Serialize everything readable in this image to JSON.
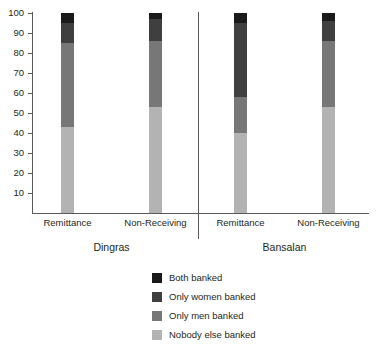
{
  "chart_data": {
    "type": "bar",
    "subtype": "stacked-percent",
    "title": "",
    "xlabel": "",
    "ylabel": "",
    "ylim": [
      0,
      100
    ],
    "yticks": [
      10,
      20,
      30,
      40,
      50,
      60,
      70,
      80,
      90,
      100
    ],
    "ytick_labels": [
      "10",
      "20",
      "30",
      "40",
      "50",
      "60",
      "70",
      "80",
      "90",
      "100"
    ],
    "grid": false,
    "legend_position": "bottom-center",
    "categories": [
      "Remittance",
      "Non-Receiving",
      "Remittance",
      "Non-Receiving"
    ],
    "groups": [
      {
        "label": "Dingras",
        "categories": [
          "Remittance",
          "Non-Receiving"
        ]
      },
      {
        "label": "Bansalan",
        "categories": [
          "Remittance",
          "Non-Receiving"
        ]
      }
    ],
    "series": [
      {
        "name": "Both banked",
        "color": "#1a1a1a",
        "values": [
          5,
          3,
          5,
          4
        ]
      },
      {
        "name": "Only women banked",
        "color": "#3f3f3f",
        "values": [
          10,
          11,
          37,
          10
        ]
      },
      {
        "name": "Only men banked",
        "color": "#777777",
        "values": [
          42,
          33,
          18,
          33
        ]
      },
      {
        "name": "Nobody else banked",
        "color": "#b3b3b3",
        "values": [
          43,
          53,
          40,
          53
        ]
      }
    ],
    "bars": [
      {
        "group": "Dingras",
        "category": "Remittance",
        "segments": [
          {
            "name": "Both banked",
            "value": 5,
            "cum_top": 100
          },
          {
            "name": "Only women banked",
            "value": 10,
            "cum_top": 95
          },
          {
            "name": "Only men banked",
            "value": 42,
            "cum_top": 85
          },
          {
            "name": "Nobody else banked",
            "value": 43,
            "cum_top": 43
          }
        ]
      },
      {
        "group": "Dingras",
        "category": "Non-Receiving",
        "segments": [
          {
            "name": "Both banked",
            "value": 3,
            "cum_top": 100
          },
          {
            "name": "Only women banked",
            "value": 11,
            "cum_top": 97
          },
          {
            "name": "Only men banked",
            "value": 33,
            "cum_top": 86
          },
          {
            "name": "Nobody else banked",
            "value": 53,
            "cum_top": 53
          }
        ]
      },
      {
        "group": "Bansalan",
        "category": "Remittance",
        "segments": [
          {
            "name": "Both banked",
            "value": 5,
            "cum_top": 100
          },
          {
            "name": "Only women banked",
            "value": 37,
            "cum_top": 95
          },
          {
            "name": "Only men banked",
            "value": 18,
            "cum_top": 58
          },
          {
            "name": "Nobody else banked",
            "value": 40,
            "cum_top": 40
          }
        ]
      },
      {
        "group": "Bansalan",
        "category": "Non-Receiving",
        "segments": [
          {
            "name": "Both banked",
            "value": 4,
            "cum_top": 100
          },
          {
            "name": "Only women banked",
            "value": 10,
            "cum_top": 96
          },
          {
            "name": "Only men banked",
            "value": 33,
            "cum_top": 86
          },
          {
            "name": "Nobody else banked",
            "value": 53,
            "cum_top": 53
          }
        ]
      }
    ]
  },
  "axis": {
    "ytick_labels": [
      "100",
      "90",
      "80",
      "70",
      "60",
      "50",
      "40",
      "30",
      "20",
      "10"
    ]
  },
  "xaxis": {
    "labels": [
      "Remittance",
      "Non-Receiving",
      "Remittance",
      "Non-Receiving"
    ],
    "group_labels": [
      "Dingras",
      "Bansalan"
    ]
  },
  "legend": {
    "items": [
      {
        "label": "Both banked",
        "color": "#1a1a1a"
      },
      {
        "label": "Only women banked",
        "color": "#3f3f3f"
      },
      {
        "label": "Only men banked",
        "color": "#777777"
      },
      {
        "label": "Nobody else banked",
        "color": "#b3b3b3"
      }
    ]
  }
}
